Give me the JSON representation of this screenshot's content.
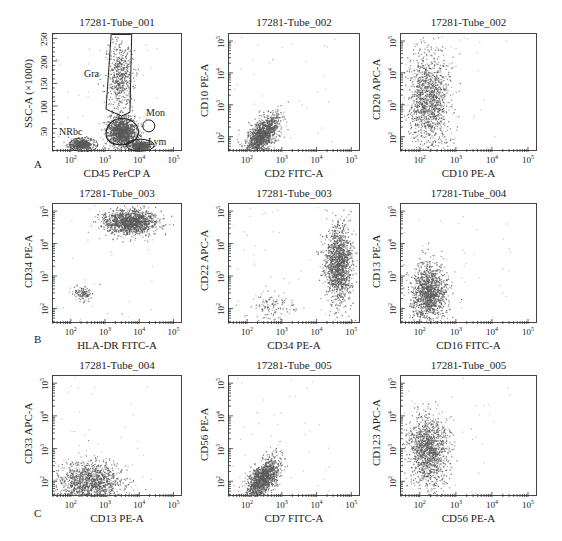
{
  "figure": {
    "row_letters": [
      "A",
      "B",
      "C"
    ],
    "colors": {
      "dots": "#5a5a5a",
      "frame": "#444444",
      "gate": "#222222",
      "background": "#ffffff"
    }
  },
  "chart_data": [
    {
      "type": "scatter",
      "id": "A1",
      "title": "17281-Tube_001",
      "xlabel": "CD45 PerCP A",
      "ylabel": "SSC-A (×1000)",
      "x_scale": "log",
      "x_ticks": [
        "10^2",
        "10^3",
        "10^4",
        "10^5"
      ],
      "y_scale": "linear",
      "y_ticks": [
        "50",
        "100",
        "150",
        "200",
        "250"
      ],
      "ylim": [
        0,
        262
      ],
      "gates": [
        {
          "name": "Gra",
          "shape": "polygon",
          "x_range": [
            "~10^3",
            "~10^3.8"
          ],
          "y_range": [
            90,
            262
          ]
        },
        {
          "name": "Mon",
          "shape": "ellipse",
          "x_center": "~10^4.2",
          "y_center": 60
        },
        {
          "name": "Lym",
          "shape": "ellipse",
          "x_center": "~10^4",
          "y_center": 15
        },
        {
          "name": "NRbc",
          "shape": "ellipse",
          "x_center": "~10^2.3",
          "y_center": 18
        },
        {
          "name": "blasts",
          "shape": "polygon",
          "x_center": "~10^3.4",
          "y_center": 45
        }
      ],
      "populations": [
        {
          "name": "Gra",
          "x_log": [
            3.0,
            3.8
          ],
          "y": [
            90,
            250
          ],
          "density": "medium"
        },
        {
          "name": "blasts",
          "x_log": [
            3.0,
            3.9
          ],
          "y": [
            10,
            80
          ],
          "density": "high"
        },
        {
          "name": "Lym",
          "x_log": [
            3.7,
            4.3
          ],
          "y": [
            5,
            25
          ],
          "density": "medium"
        },
        {
          "name": "NRbc",
          "x_log": [
            1.9,
            2.6
          ],
          "y": [
            5,
            30
          ],
          "density": "medium"
        }
      ],
      "grid": false
    },
    {
      "type": "scatter",
      "id": "A2",
      "title": "17281-Tube_002",
      "xlabel": "CD2 FITC-A",
      "ylabel": "CD10 PE-A",
      "x_scale": "log",
      "x_ticks": [
        "10^2",
        "10^3",
        "10^4",
        "10^5"
      ],
      "y_scale": "log",
      "y_ticks": [
        "10^2",
        "10^3",
        "10^4",
        "10^5"
      ],
      "populations": [
        {
          "name": "main",
          "x_log": [
            1.9,
            2.9
          ],
          "y_log": [
            1.7,
            3.0
          ],
          "center": [
            2.4,
            2.1
          ],
          "shape": "diagonal-cloud"
        }
      ],
      "grid": false
    },
    {
      "type": "scatter",
      "id": "A3",
      "title": "17281-Tube_002",
      "xlabel": "CD10 PE-A",
      "ylabel": "CD20 APC-A",
      "x_scale": "log",
      "x_ticks": [
        "10^2",
        "10^3",
        "10^4",
        "10^5"
      ],
      "y_scale": "log",
      "y_ticks": [
        "10^2",
        "10^3",
        "10^4",
        "10^5"
      ],
      "populations": [
        {
          "name": "main",
          "x_log": [
            1.6,
            2.8
          ],
          "y_log": [
            1.6,
            4.8
          ],
          "center": [
            2.2,
            3.2
          ],
          "shape": "vertical-band"
        }
      ],
      "grid": false
    },
    {
      "type": "scatter",
      "id": "B1",
      "title": "17281-Tube_003",
      "xlabel": "HLA-DR FITC-A",
      "ylabel": "CD34 PE-A",
      "x_scale": "log",
      "x_ticks": [
        "10^2",
        "10^3",
        "10^4",
        "10^5"
      ],
      "y_scale": "log",
      "y_ticks": [
        "10^2",
        "10^3",
        "10^4",
        "10^5"
      ],
      "populations": [
        {
          "name": "CD34+HLA-DR+",
          "x_log": [
            2.9,
            4.5
          ],
          "y_log": [
            4.2,
            5.0
          ],
          "center": [
            3.7,
            4.7
          ],
          "density": "high"
        },
        {
          "name": "CD34-",
          "x_log": [
            2.0,
            2.6
          ],
          "y_log": [
            2.3,
            2.8
          ],
          "center": [
            2.3,
            2.5
          ],
          "density": "low"
        }
      ],
      "grid": false
    },
    {
      "type": "scatter",
      "id": "B2",
      "title": "17281-Tube_003",
      "xlabel": "CD34 PE-A",
      "ylabel": "CD22 APC-A",
      "x_scale": "log",
      "x_ticks": [
        "10^2",
        "10^3",
        "10^4",
        "10^5"
      ],
      "y_scale": "log",
      "y_ticks": [
        "10^2",
        "10^3",
        "10^4",
        "10^5"
      ],
      "populations": [
        {
          "name": "CD34+",
          "x_log": [
            4.2,
            5.0
          ],
          "y_log": [
            1.7,
            4.2
          ],
          "center": [
            4.6,
            3.4
          ],
          "density": "high"
        },
        {
          "name": "CD34-",
          "x_log": [
            2.0,
            3.5
          ],
          "y_log": [
            1.7,
            2.6
          ],
          "center": [
            2.7,
            2.1
          ],
          "density": "low"
        }
      ],
      "grid": false
    },
    {
      "type": "scatter",
      "id": "B3",
      "title": "17281-Tube_004",
      "xlabel": "CD16 FITC-A",
      "ylabel": "CD13 PE-A",
      "x_scale": "log",
      "x_ticks": [
        "10^2",
        "10^3",
        "10^4",
        "10^5"
      ],
      "y_scale": "log",
      "y_ticks": [
        "10^2",
        "10^3",
        "10^4",
        "10^5"
      ],
      "populations": [
        {
          "name": "main",
          "x_log": [
            1.8,
            2.8
          ],
          "y_log": [
            1.6,
            3.5
          ],
          "center": [
            2.2,
            2.5
          ],
          "shape": "oval"
        }
      ],
      "grid": false
    },
    {
      "type": "scatter",
      "id": "C1",
      "title": "17281-Tube_004",
      "xlabel": "CD13 PE-A",
      "ylabel": "CD33 APC-A",
      "x_scale": "log",
      "x_ticks": [
        "10^2",
        "10^3",
        "10^4",
        "10^5"
      ],
      "y_scale": "log",
      "y_ticks": [
        "10^2",
        "10^3",
        "10^4",
        "10^5"
      ],
      "populations": [
        {
          "name": "main",
          "x_log": [
            1.6,
            3.6
          ],
          "y_log": [
            1.6,
            3.0
          ],
          "center": [
            2.5,
            2.0
          ],
          "shape": "wide-cloud"
        }
      ],
      "grid": false
    },
    {
      "type": "scatter",
      "id": "C2",
      "title": "17281-Tube_005",
      "xlabel": "CD7 FITC-A",
      "ylabel": "CD56 PE-A",
      "x_scale": "log",
      "x_ticks": [
        "10^2",
        "10^3",
        "10^4",
        "10^5"
      ],
      "y_scale": "log",
      "y_ticks": [
        "10^2",
        "10^3",
        "10^4",
        "10^5"
      ],
      "populations": [
        {
          "name": "main",
          "x_log": [
            1.9,
            2.9
          ],
          "y_log": [
            1.6,
            2.9
          ],
          "center": [
            2.4,
            2.1
          ],
          "shape": "diagonal-cloud"
        }
      ],
      "grid": false
    },
    {
      "type": "scatter",
      "id": "C3",
      "title": "17281-Tube_005",
      "xlabel": "CD56 PE-A",
      "ylabel": "CD123 APC-A",
      "x_scale": "log",
      "x_ticks": [
        "10^2",
        "10^3",
        "10^4",
        "10^5"
      ],
      "y_scale": "log",
      "y_ticks": [
        "10^2",
        "10^3",
        "10^4",
        "10^5"
      ],
      "populations": [
        {
          "name": "main",
          "x_log": [
            1.6,
            2.8
          ],
          "y_log": [
            1.8,
            4.1
          ],
          "center": [
            2.2,
            3.0
          ],
          "shape": "oval"
        }
      ],
      "grid": false
    }
  ]
}
